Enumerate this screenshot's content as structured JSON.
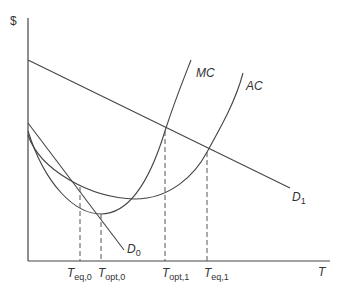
{
  "diagram": {
    "y_axis_label": "$",
    "x_axis_label": "T",
    "curves": {
      "mc": "MC",
      "ac": "AC",
      "d0": "D",
      "d0_sub": "0",
      "d1": "D",
      "d1_sub": "1"
    },
    "ticks": [
      {
        "main": "T",
        "sub": "eq,0"
      },
      {
        "main": "T",
        "sub": "opt,0"
      },
      {
        "main": "T",
        "sub": "opt,1"
      },
      {
        "main": "T",
        "sub": "eq,1"
      }
    ],
    "colors": {
      "line": "#444444",
      "text": "#333333",
      "background": "#ffffff"
    }
  }
}
